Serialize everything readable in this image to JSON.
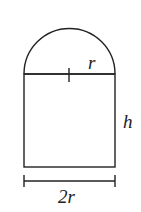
{
  "diagram": {
    "labels": {
      "radius": "r",
      "height": "h",
      "width": "2r"
    },
    "colors": {
      "stroke": "#222222",
      "background": "#ffffff"
    }
  }
}
